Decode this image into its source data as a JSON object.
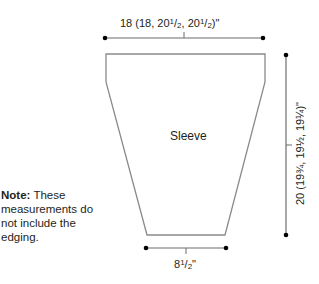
{
  "diagram": {
    "type": "knitting-schematic",
    "piece_label": "Sleeve",
    "dimensions": {
      "top_width": "18 (18, 20½, 20½)\"",
      "top_width_parts": {
        "main": "18 (18, 20",
        "frac1": "1",
        "den1": "2",
        "mid": ", 20",
        "frac2": "1",
        "den2": "2",
        "end": ")\""
      },
      "length": "20 (19¾, 19½, 19¼)\"",
      "bottom_width": "8½\"",
      "bottom_width_parts": {
        "main": "8",
        "num": "1",
        "den": "2",
        "end": "\""
      }
    },
    "note": {
      "bold": "Note:",
      "text": " These measurements do not include the edging."
    },
    "colors": {
      "outline": "#8a8a8a",
      "dimension_line": "#6d6d6d",
      "dot": "#000000",
      "text": "#231f20"
    }
  }
}
